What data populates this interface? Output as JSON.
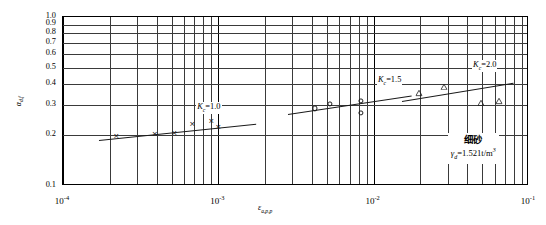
{
  "chart_data": {
    "type": "scatter",
    "title": "",
    "xlabel": "εa,p,p",
    "ylabel": "αd,f",
    "xscale": "log",
    "yscale": "log",
    "xlim": [
      0.0001,
      0.1
    ],
    "ylim": [
      0.1,
      1.0
    ],
    "grid": true,
    "legend_position": "none",
    "x_tick_labels": [
      "10-4",
      "10-3",
      "10-2",
      "10-1"
    ],
    "x_tick_values": [
      0.0001,
      0.001,
      0.01,
      0.1
    ],
    "y_tick_labels": [
      "1.0",
      "0.9",
      "0.8",
      "0.7",
      "0.6",
      "0.5",
      "0.4",
      "0.3",
      "0.2",
      "0.1"
    ],
    "y_tick_values": [
      1.0,
      0.9,
      0.8,
      0.7,
      0.6,
      0.5,
      0.4,
      0.3,
      0.2,
      0.1
    ],
    "series": [
      {
        "name": "Kc=1.0",
        "marker": "cross",
        "label": "K",
        "label_sub": "c",
        "label_eq": "=1.0",
        "points": [
          {
            "x": 0.00022,
            "y": 0.198
          },
          {
            "x": 0.00039,
            "y": 0.204
          },
          {
            "x": 0.00052,
            "y": 0.206
          },
          {
            "x": 0.00068,
            "y": 0.233
          },
          {
            "x": 0.0009,
            "y": 0.243
          },
          {
            "x": 0.001,
            "y": 0.222
          }
        ],
        "fit": {
          "x1": 0.00017,
          "y1": 0.186,
          "x2": 0.00175,
          "y2": 0.232
        }
      },
      {
        "name": "Kc=1.5",
        "marker": "circle",
        "label": "K",
        "label_sub": "c",
        "label_eq": "=1.5",
        "points": [
          {
            "x": 0.0042,
            "y": 0.288
          },
          {
            "x": 0.0052,
            "y": 0.305
          },
          {
            "x": 0.0083,
            "y": 0.318
          },
          {
            "x": 0.0083,
            "y": 0.272
          }
        ],
        "fit": {
          "x1": 0.0028,
          "y1": 0.268,
          "x2": 0.0175,
          "y2": 0.345
        }
      },
      {
        "name": "Kc=2.0",
        "marker": "triangle",
        "label": "K",
        "label_sub": "c",
        "label_eq": "=2.0",
        "points": [
          {
            "x": 0.0195,
            "y": 0.392
          },
          {
            "x": 0.0285,
            "y": 0.428
          },
          {
            "x": 0.0492,
            "y": 0.345
          },
          {
            "x": 0.064,
            "y": 0.352
          }
        ],
        "fit": {
          "x1": 0.0152,
          "y1": 0.318,
          "x2": 0.079,
          "y2": 0.408
        }
      }
    ],
    "annotations": [
      {
        "name": "soil-type",
        "text": "细砂"
      },
      {
        "name": "dry-density",
        "text": "γd=1.521t/m3",
        "symbol": "γ",
        "sub": "d",
        "eq": "=1.521t/m",
        "sup": "3"
      }
    ]
  },
  "axis": {
    "y_label_symbol": "α",
    "y_label_sub": "d,f",
    "x_label_symbol": "ε",
    "x_label_sub": "a,p,p"
  },
  "ticks": {
    "x": [
      {
        "mantissa": "10",
        "exp": "-4"
      },
      {
        "mantissa": "10",
        "exp": "-3"
      },
      {
        "mantissa": "10",
        "exp": "-2"
      },
      {
        "mantissa": "10",
        "exp": "-1"
      }
    ],
    "y": [
      "1.0",
      "0.9",
      "0.8",
      "0.7",
      "0.6",
      "0.5",
      "0.4",
      "0.3",
      "0.2",
      "0.1"
    ]
  },
  "notes": {
    "soil": "细砂",
    "gamma_symbol": "γ",
    "gamma_sub": "d",
    "gamma_eq": "=1.521t/m",
    "gamma_sup": "3"
  },
  "colors": {
    "frame": "#000000",
    "grid": "#3a3a3a",
    "marker": "#1a1a1a",
    "background": "#ffffff"
  }
}
